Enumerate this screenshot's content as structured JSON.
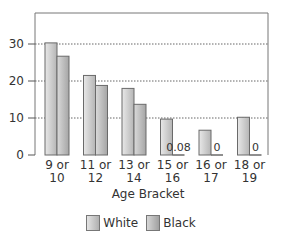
{
  "chart_data": {
    "type": "bar",
    "title": "",
    "xlabel": "Age Bracket",
    "ylabel": "",
    "ylim": [
      0,
      38
    ],
    "yticks": [
      0,
      10,
      20,
      30
    ],
    "grid": "horizontal dotted",
    "legend_position": "bottom",
    "categories": [
      "9 or 10",
      "11 or 12",
      "13 or 14",
      "15 or 16",
      "16 or 17",
      "18 or 19"
    ],
    "category_lines": [
      [
        "9 or",
        "10"
      ],
      [
        "11 or",
        "12"
      ],
      [
        "13 or",
        "14"
      ],
      [
        "15 or",
        "16"
      ],
      [
        "16 or",
        "17"
      ],
      [
        "18 or",
        "19"
      ]
    ],
    "series": [
      {
        "name": "White",
        "values": [
          30.3,
          21.5,
          18.0,
          9.7,
          6.7,
          10.2
        ]
      },
      {
        "name": "Black",
        "values": [
          26.7,
          18.8,
          13.7,
          0.08,
          0,
          0
        ]
      }
    ],
    "annotations": [
      {
        "category": "15 or 16",
        "series": "Black",
        "text": "0.08"
      },
      {
        "category": "16 or 17",
        "series": "Black",
        "text": "0"
      },
      {
        "category": "18 or 19",
        "series": "Black",
        "text": "0"
      }
    ]
  },
  "legend": {
    "white_label": "White",
    "black_label": "Black"
  }
}
